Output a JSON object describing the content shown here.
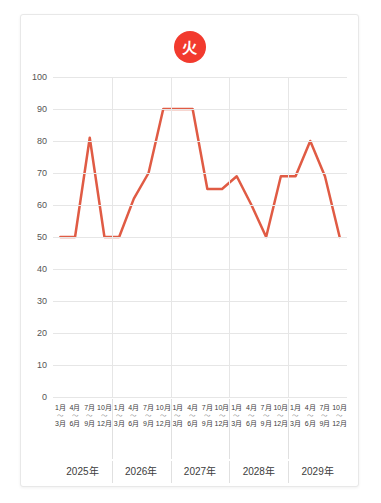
{
  "badge": {
    "label": "火",
    "name": "tuesday-badge",
    "color": "#F23A2E",
    "text_color": "#FFFFFF"
  },
  "chart_data": {
    "type": "line",
    "title": "",
    "subtitle": "",
    "xlabel": "",
    "ylabel": "",
    "ylim": [
      0,
      100
    ],
    "y_ticks": [
      0,
      10,
      20,
      30,
      40,
      50,
      60,
      70,
      80,
      90,
      100
    ],
    "grid": true,
    "legend_position": "none",
    "line_color": "#E05B44",
    "line_width": 2.5,
    "markers": false,
    "year_groups": [
      "2025年",
      "2026年",
      "2027年",
      "2028年",
      "2029年"
    ],
    "quarter_labels": [
      {
        "start": "1月",
        "tilde": "〜",
        "end": "3月"
      },
      {
        "start": "4月",
        "tilde": "〜",
        "end": "6月"
      },
      {
        "start": "7月",
        "tilde": "〜",
        "end": "9月"
      },
      {
        "start": "10月",
        "tilde": "〜",
        "end": "12月"
      }
    ],
    "categories": [
      "2025年 1月〜3月",
      "2025年 4月〜6月",
      "2025年 7月〜9月",
      "2025年 10月〜12月",
      "2026年 1月〜3月",
      "2026年 4月〜6月",
      "2026年 7月〜9月",
      "2026年 10月〜12月",
      "2027年 1月〜3月",
      "2027年 4月〜6月",
      "2027年 7月〜9月",
      "2027年 10月〜12月",
      "2028年 1月〜3月",
      "2028年 4月〜6月",
      "2028年 7月〜9月",
      "2028年 10月〜12月",
      "2029年 1月〜3月",
      "2029年 4月〜6月",
      "2029年 7月〜9月",
      "2029年 10月〜12月"
    ],
    "values": [
      50,
      50,
      81,
      50,
      50,
      62,
      70,
      90,
      90,
      90,
      65,
      65,
      69,
      60,
      50,
      69,
      69,
      80,
      69,
      50
    ]
  }
}
